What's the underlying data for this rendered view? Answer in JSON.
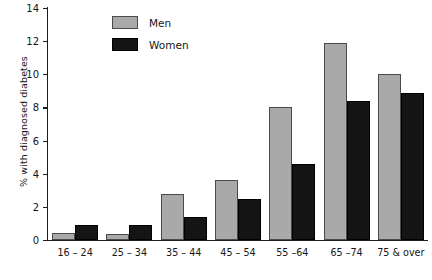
{
  "chart_data": {
    "type": "bar",
    "title": "",
    "xlabel": "",
    "ylabel": "% with diagnosed diabetes",
    "ylim": [
      0,
      14
    ],
    "yticks": [
      0,
      2,
      4,
      6,
      8,
      10,
      12,
      14
    ],
    "grid": false,
    "legend_position": "top-left-inside",
    "categories": [
      "16 – 24",
      "25 – 34",
      "35 – 44",
      "45 – 54",
      "55 –64",
      "65 –74",
      "75 & over"
    ],
    "series": [
      {
        "name": "Men",
        "color": "#a9a9a9",
        "values": [
          0.4,
          0.35,
          2.8,
          3.6,
          8.0,
          11.9,
          10.0
        ]
      },
      {
        "name": "Women",
        "color": "#141414",
        "values": [
          0.9,
          0.9,
          1.4,
          2.5,
          4.6,
          8.4,
          8.9
        ]
      }
    ]
  }
}
